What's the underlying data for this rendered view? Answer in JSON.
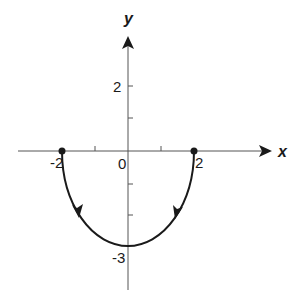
{
  "diagram": {
    "x_axis_label": "x",
    "y_axis_label": "y",
    "tick_labels": {
      "x_neg2": "-2",
      "x_zero": "0",
      "x_pos2": "2",
      "y_pos2": "2",
      "y_neg3": "-3"
    },
    "curve": {
      "description": "lower half of ellipse x^2/4 + y^2/9 = 1",
      "start_point": [
        -2,
        0
      ],
      "end_point": [
        2,
        0
      ],
      "vertex": [
        0,
        -3
      ],
      "orientation_arrows": "both branches point downward toward (0,-3)"
    },
    "endpoints": [
      "(-2, 0)",
      "(2, 0)"
    ],
    "colors": {
      "stroke": "#1a1a1a",
      "axis": "#555555",
      "background": "#ffffff"
    }
  }
}
